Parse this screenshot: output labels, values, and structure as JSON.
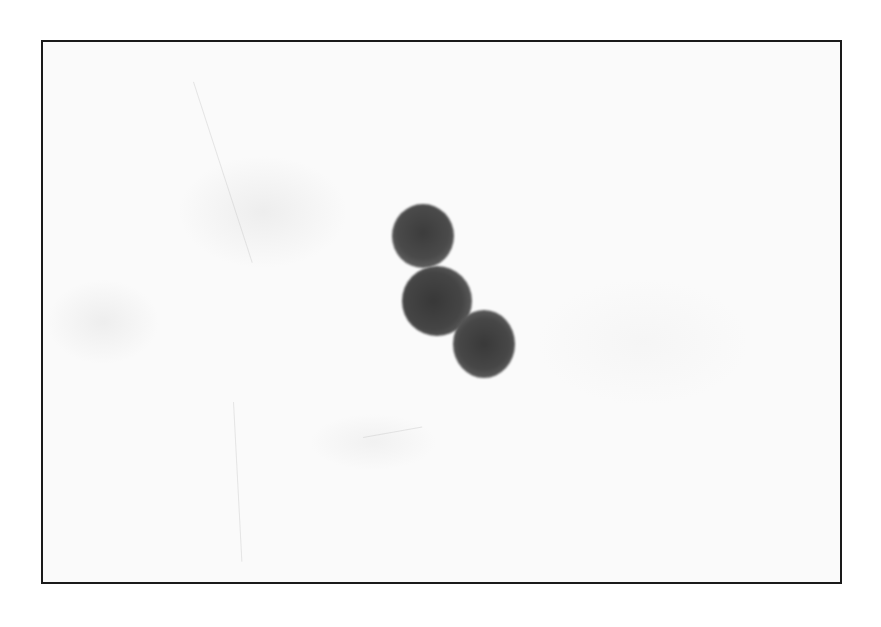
{
  "image": {
    "description": "Brightfield micrograph of three stained round cells in a diagonal cluster on a pale background",
    "frame_color": "#1a1a1a",
    "background_color": "#fafafa"
  },
  "cells": [
    {
      "label": "cell-top",
      "cx": 421,
      "cy": 234,
      "r": 31,
      "color": "#4a4a4a"
    },
    {
      "label": "cell-middle",
      "cx": 435,
      "cy": 298,
      "r": 35,
      "color": "#454545"
    },
    {
      "label": "cell-bottom",
      "cx": 482,
      "cy": 341,
      "r": 30,
      "color": "#474747"
    }
  ]
}
